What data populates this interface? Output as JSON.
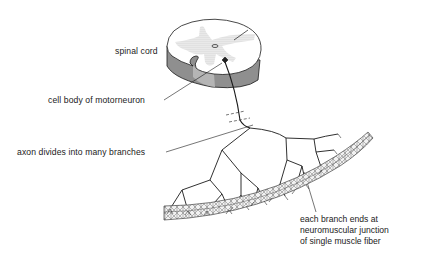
{
  "figure": {
    "type": "anatomical diagram",
    "colors": {
      "line": "#1a1a1a",
      "gray_matter": "#cfcfcf",
      "cord_side": "#8f8f8f",
      "muscle": "#9a9a9a",
      "background": "#ffffff"
    }
  },
  "labels": {
    "spinal_cord": "spinal cord",
    "cell_body": "cell body of motorneuron",
    "axon_divides": "axon divides into many branches",
    "branch_ends": [
      "each branch ends at",
      "neuromuscular junction",
      "of single muscle fiber"
    ]
  }
}
